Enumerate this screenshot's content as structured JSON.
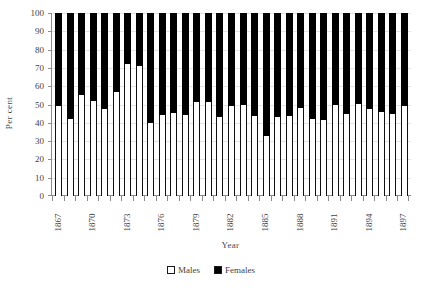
{
  "chart_data": {
    "type": "bar",
    "subtype": "stacked-100-percent",
    "title": "",
    "xlabel": "Year",
    "ylabel": "Per cent",
    "ylim": [
      0,
      100
    ],
    "yticks": [
      0,
      10,
      20,
      30,
      40,
      50,
      60,
      70,
      80,
      90,
      100
    ],
    "grid": true,
    "legend_position": "bottom",
    "categories": [
      "1867",
      "1868",
      "1869",
      "1870",
      "1871",
      "1872",
      "1873",
      "1874",
      "1875",
      "1876",
      "1877",
      "1878",
      "1879",
      "1880",
      "1881",
      "1882",
      "1883",
      "1884",
      "1885",
      "1886",
      "1887",
      "1888",
      "1889",
      "1890",
      "1891",
      "1892",
      "1893",
      "1894",
      "1895",
      "1896",
      "1897"
    ],
    "tick_labels": [
      "1867",
      "",
      "",
      "1870",
      "",
      "",
      "1873",
      "",
      "",
      "1876",
      "",
      "",
      "1879",
      "",
      "",
      "1882",
      "",
      "",
      "1885",
      "",
      "",
      "1888",
      "",
      "",
      "1891",
      "",
      "",
      "1894",
      "",
      "",
      "1897"
    ],
    "series": [
      {
        "name": "Males",
        "color": "#ffffff",
        "values": [
          49,
          42,
          55,
          52,
          47.5,
          57,
          72,
          71,
          40,
          44,
          45.5,
          44,
          51.5,
          51.5,
          43,
          49,
          49.5,
          43.5,
          33,
          43,
          43.5,
          48,
          42,
          41.5,
          49.5,
          45,
          50.5,
          47.5,
          46,
          45,
          49
        ]
      },
      {
        "name": "Females",
        "color": "#000000",
        "values": [
          51,
          58,
          45,
          48,
          52.5,
          43,
          28,
          29,
          60,
          56,
          54.5,
          56,
          48.5,
          48.5,
          57,
          51,
          50.5,
          56.5,
          67,
          57,
          56.5,
          52,
          58,
          58.5,
          50.5,
          55,
          49.5,
          52.5,
          54,
          55,
          51
        ]
      }
    ]
  },
  "legend": {
    "items": [
      {
        "label": "Males",
        "swatch": "#ffffff"
      },
      {
        "label": "Females",
        "swatch": "#000000"
      }
    ]
  }
}
